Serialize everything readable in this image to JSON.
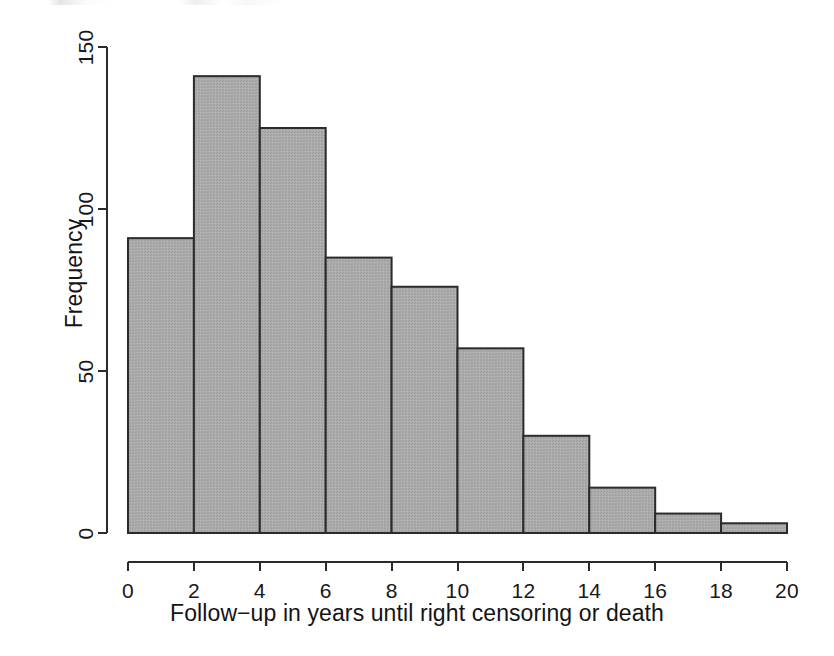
{
  "chart_data": {
    "type": "bar",
    "subtype": "histogram",
    "title": "",
    "xlabel": "Follow−up in years until right censoring or death",
    "ylabel": "Frequency",
    "bin_width": 2,
    "bin_edges": [
      0,
      2,
      4,
      6,
      8,
      10,
      12,
      14,
      16,
      18,
      20
    ],
    "categories": [
      "0–2",
      "2–4",
      "4–6",
      "6–8",
      "8–10",
      "10–12",
      "12–14",
      "14–16",
      "16–18",
      "18–20"
    ],
    "values": [
      91,
      141,
      125,
      85,
      76,
      57,
      30,
      14,
      6,
      3
    ],
    "xlim": [
      0,
      20
    ],
    "ylim": [
      0,
      150
    ],
    "xticks": [
      "0",
      "2",
      "4",
      "6",
      "8",
      "10",
      "12",
      "14",
      "16",
      "18",
      "20"
    ],
    "xtick_values": [
      0,
      2,
      4,
      6,
      8,
      10,
      12,
      14,
      16,
      18,
      20
    ],
    "yticks": [
      "0",
      "50",
      "100",
      "150"
    ],
    "ytick_values": [
      0,
      50,
      100,
      150
    ],
    "grid": false,
    "legend": null,
    "bar_fill_color": "#a9a9a9",
    "bar_border_color": "#2b2b2b",
    "axis_color": "#2b2b2b",
    "background_color": "#ffffff"
  }
}
